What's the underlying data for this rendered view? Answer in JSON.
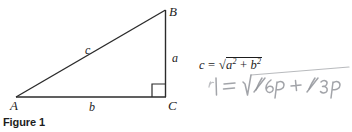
{
  "figure": {
    "caption": "Figure 1",
    "vertices": [
      {
        "name": "A",
        "label": "A",
        "x": 16,
        "y": 97
      },
      {
        "name": "B",
        "label": "B",
        "x": 165,
        "y": 10
      },
      {
        "name": "C",
        "label": "C",
        "x": 165,
        "y": 97
      }
    ],
    "sides": [
      {
        "name": "a",
        "label": "a",
        "description": "vertical-leg-BC"
      },
      {
        "name": "b",
        "label": "b",
        "description": "horizontal-leg-AC"
      },
      {
        "name": "c",
        "label": "c",
        "description": "hypotenuse-AB"
      }
    ],
    "right_angle_at": "C",
    "line_color": "#2b2b2b"
  },
  "formulas": {
    "typeset": {
      "lhs": "c",
      "equals": "=",
      "radical_sign": "√",
      "term_1_base": "a",
      "term_1_exp": "2",
      "plus": "+",
      "term_2_base": "b",
      "term_2_exp": "2",
      "plain_text": "c = √(a² + b²)"
    },
    "handwritten": {
      "plain_text": "r| = √(1/6p + 1/3p)",
      "color": "#8e9096",
      "style": "pencil-annotation"
    }
  }
}
